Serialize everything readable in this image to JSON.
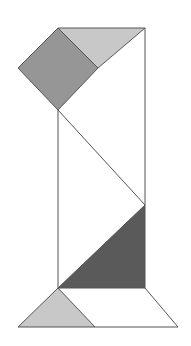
{
  "canvas": {
    "width": 191,
    "height": 346,
    "background": "#ffffff",
    "title": "Geometric tangram figure"
  },
  "style": {
    "outline_color": "#555555",
    "outline_width": 1,
    "fill_white": "#ffffff",
    "fill_light_gray": "#c8c8c8",
    "fill_medium_gray": "#969696",
    "fill_dark_gray": "#5a5a5a"
  },
  "shapes": [
    {
      "id": "top-right-white-triangle",
      "name": "top-right-white-triangle",
      "fill": "#ffffff",
      "points": "98,68 145,28 145,115"
    },
    {
      "id": "top-light-gray-triangle",
      "name": "top-light-gray-triangle",
      "fill": "#c8c8c8",
      "points": "58,28 145,28 98,68"
    },
    {
      "id": "rotated-square-medium-gray",
      "name": "rotated-square-medium-gray",
      "fill": "#969696",
      "points": "58,28 98,68 58,110 18,68"
    },
    {
      "id": "middle-white-zigzag",
      "name": "middle-white-zigzag",
      "fill": "#ffffff",
      "points": "58,110 145,28 145,205 58,288"
    },
    {
      "id": "lower-dark-gray-triangle",
      "name": "lower-dark-gray-triangle",
      "fill": "#5a5a5a",
      "points": "145,205 145,288 58,288"
    },
    {
      "id": "base-white-trapezoid",
      "name": "base-white-trapezoid",
      "fill": "#ffffff",
      "points": "58,288 145,288 178,327 18,327"
    },
    {
      "id": "base-light-gray-triangle",
      "name": "base-light-gray-triangle",
      "fill": "#c8c8c8",
      "points": "58,288 95,327 18,327"
    }
  ],
  "edges": [
    {
      "id": "edge-left-vertical",
      "name": "edge-left-vertical",
      "x1": 58,
      "y1": 110,
      "x2": 58,
      "y2": 288
    },
    {
      "id": "edge-right-vertical",
      "name": "edge-right-vertical",
      "x1": 145,
      "y1": 28,
      "x2": 145,
      "y2": 288
    },
    {
      "id": "edge-top-horizontal",
      "name": "edge-top-horizontal",
      "x1": 58,
      "y1": 28,
      "x2": 145,
      "y2": 28
    },
    {
      "id": "edge-square-upper-left",
      "name": "edge-square-upper-left",
      "x1": 58,
      "y1": 28,
      "x2": 18,
      "y2": 68
    },
    {
      "id": "edge-square-lower-left",
      "name": "edge-square-lower-left",
      "x1": 18,
      "y1": 68,
      "x2": 58,
      "y2": 110
    },
    {
      "id": "edge-square-upper-right",
      "name": "edge-square-upper-right",
      "x1": 58,
      "y1": 28,
      "x2": 98,
      "y2": 68
    },
    {
      "id": "edge-square-lower-right",
      "name": "edge-square-lower-right",
      "x1": 98,
      "y1": 68,
      "x2": 58,
      "y2": 110
    },
    {
      "id": "edge-upper-diagonal",
      "name": "edge-upper-diagonal",
      "x1": 98,
      "y1": 68,
      "x2": 145,
      "y2": 28
    },
    {
      "id": "edge-main-diagonal",
      "name": "edge-main-diagonal",
      "x1": 58,
      "y1": 110,
      "x2": 145,
      "y2": 205
    },
    {
      "id": "edge-lower-diagonal",
      "name": "edge-lower-diagonal",
      "x1": 145,
      "y1": 205,
      "x2": 58,
      "y2": 288
    },
    {
      "id": "edge-base-top",
      "name": "edge-base-top",
      "x1": 58,
      "y1": 288,
      "x2": 145,
      "y2": 288
    },
    {
      "id": "edge-base-left-slant",
      "name": "edge-base-left-slant",
      "x1": 58,
      "y1": 288,
      "x2": 18,
      "y2": 327
    },
    {
      "id": "edge-base-right-slant",
      "name": "edge-base-right-slant",
      "x1": 145,
      "y1": 288,
      "x2": 178,
      "y2": 327
    },
    {
      "id": "edge-base-bottom",
      "name": "edge-base-bottom",
      "x1": 18,
      "y1": 327,
      "x2": 178,
      "y2": 327
    },
    {
      "id": "edge-base-inner-diagonal",
      "name": "edge-base-inner-diagonal",
      "x1": 58,
      "y1": 288,
      "x2": 95,
      "y2": 327
    }
  ]
}
